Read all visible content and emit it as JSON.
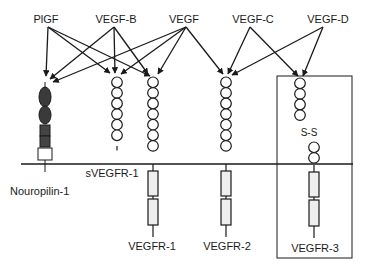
{
  "diagram": {
    "ligands": [
      {
        "id": "plgf",
        "label": "PlGF",
        "x": 46,
        "y": 14,
        "ax": 48,
        "ay": 27
      },
      {
        "id": "vegf-b",
        "label": "VEGF-B",
        "x": 116,
        "y": 14,
        "ax": 114,
        "ay": 27
      },
      {
        "id": "vegf",
        "label": "VEGF",
        "x": 184,
        "y": 14,
        "ax": 186,
        "ay": 27
      },
      {
        "id": "vegf-c",
        "label": "VEGF-C",
        "x": 253,
        "y": 14,
        "ax": 250,
        "ay": 27
      },
      {
        "id": "vegf-d",
        "label": "VEGF-D",
        "x": 328,
        "y": 14,
        "ax": 323,
        "ay": 27
      }
    ],
    "receptors": [
      {
        "id": "nrp1",
        "label": "Nouropilin-1",
        "label_x": 10,
        "label_y": 191,
        "label_align": "left"
      },
      {
        "id": "svegfr1",
        "label": "sVEGFR-1",
        "label_x": 112,
        "label_y": 168
      },
      {
        "id": "vegfr1",
        "label": "VEGFR-1",
        "label_x": 152,
        "label_y": 244
      },
      {
        "id": "vegfr2",
        "label": "VEGFR-2",
        "label_x": 227,
        "label_y": 244
      },
      {
        "id": "vegfr3",
        "label": "VEGFR-3",
        "label_x": 315,
        "label_y": 246
      }
    ],
    "disulfide_label": "S-S",
    "arrows": [
      {
        "from": "PlGF",
        "to": "Nouropilin-1",
        "x1": 48,
        "y1": 27,
        "x2": 46,
        "y2": 76
      },
      {
        "from": "PlGF",
        "to": "sVEGFR-1",
        "x1": 48,
        "y1": 27,
        "x2": 110,
        "y2": 73
      },
      {
        "from": "PlGF",
        "to": "VEGFR-1",
        "x1": 48,
        "y1": 27,
        "x2": 150,
        "y2": 76
      },
      {
        "from": "VEGF-B",
        "to": "Nouropilin-1",
        "x1": 114,
        "y1": 27,
        "x2": 50,
        "y2": 79
      },
      {
        "from": "VEGF-B",
        "to": "sVEGFR-1",
        "x1": 114,
        "y1": 27,
        "x2": 115,
        "y2": 73
      },
      {
        "from": "VEGF-B",
        "to": "VEGFR-1",
        "x1": 114,
        "y1": 27,
        "x2": 148,
        "y2": 74
      },
      {
        "from": "VEGF",
        "to": "Nouropilin-1",
        "x1": 186,
        "y1": 27,
        "x2": 53,
        "y2": 82
      },
      {
        "from": "VEGF",
        "to": "sVEGFR-1",
        "x1": 186,
        "y1": 27,
        "x2": 121,
        "y2": 74
      },
      {
        "from": "VEGF",
        "to": "VEGFR-1",
        "x1": 186,
        "y1": 27,
        "x2": 158,
        "y2": 74
      },
      {
        "from": "VEGF",
        "to": "VEGFR-2",
        "x1": 186,
        "y1": 27,
        "x2": 223,
        "y2": 74
      },
      {
        "from": "VEGF-C",
        "to": "VEGFR-2",
        "x1": 250,
        "y1": 27,
        "x2": 228,
        "y2": 74
      },
      {
        "from": "VEGF-C",
        "to": "VEGFR-3",
        "x1": 250,
        "y1": 27,
        "x2": 298,
        "y2": 76
      },
      {
        "from": "VEGF-D",
        "to": "VEGFR-2",
        "x1": 323,
        "y1": 27,
        "x2": 232,
        "y2": 75
      },
      {
        "from": "VEGF-D",
        "to": "VEGFR-3",
        "x1": 323,
        "y1": 27,
        "x2": 303,
        "y2": 76
      }
    ],
    "colors": {
      "line": "#1a1a1a",
      "domain_fill": "#ffffff",
      "tm_fill": "#eeeeee",
      "nrp_dark": "#3a3a3a"
    }
  }
}
